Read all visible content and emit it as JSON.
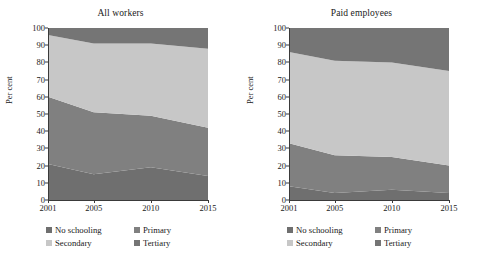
{
  "figure": {
    "ylabel": "Per cent",
    "series_names": [
      "No schooling",
      "Primary",
      "Secondary",
      "Tertiary"
    ],
    "colors": {
      "no_schooling": "#6f6f6f",
      "primary": "#808080",
      "secondary": "#c7c7c7",
      "tertiary": "#757575"
    },
    "x_ticks": [
      "2001",
      "2005",
      "2010",
      "2015"
    ],
    "y_ticks": [
      "0",
      "10",
      "20",
      "30",
      "40",
      "50",
      "60",
      "70",
      "80",
      "90",
      "100"
    ]
  },
  "legend": {
    "items": [
      {
        "label": "No schooling",
        "swatch": "#6f6f6f"
      },
      {
        "label": "Primary",
        "swatch": "#808080"
      },
      {
        "label": "Secondary",
        "swatch": "#c7c7c7"
      },
      {
        "label": "Tertiary",
        "swatch": "#757575"
      }
    ]
  },
  "chart_data": [
    {
      "type": "area",
      "title": "All workers",
      "xlabel": "",
      "ylabel": "Per cent",
      "x": [
        2001,
        2005,
        2010,
        2015
      ],
      "xlim": [
        2001,
        2015
      ],
      "ylim": [
        0,
        100
      ],
      "stacked": true,
      "grid": false,
      "legend_position": "bottom",
      "series": [
        {
          "name": "No schooling",
          "values": [
            21,
            15,
            19,
            14
          ]
        },
        {
          "name": "Primary",
          "values": [
            39,
            36,
            30,
            28
          ]
        },
        {
          "name": "Secondary",
          "values": [
            36,
            40,
            42,
            46
          ]
        },
        {
          "name": "Tertiary",
          "values": [
            4,
            9,
            9,
            12
          ]
        }
      ]
    },
    {
      "type": "area",
      "title": "Paid employees",
      "xlabel": "",
      "ylabel": "Per cent",
      "x": [
        2001,
        2005,
        2010,
        2015
      ],
      "xlim": [
        2001,
        2015
      ],
      "ylim": [
        0,
        100
      ],
      "stacked": true,
      "grid": false,
      "legend_position": "bottom",
      "series": [
        {
          "name": "No schooling",
          "values": [
            8,
            4,
            6,
            4
          ]
        },
        {
          "name": "Primary",
          "values": [
            25,
            22,
            19,
            16
          ]
        },
        {
          "name": "Secondary",
          "values": [
            53,
            55,
            55,
            55
          ]
        },
        {
          "name": "Tertiary",
          "values": [
            14,
            19,
            20,
            25
          ]
        }
      ]
    }
  ]
}
